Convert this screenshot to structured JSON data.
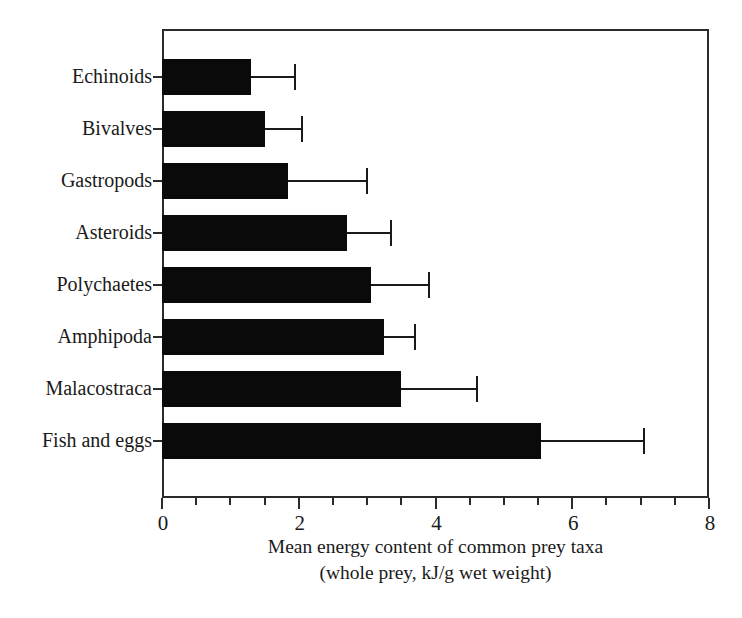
{
  "chart_data": {
    "type": "bar",
    "orientation": "horizontal",
    "title": "",
    "xlabel": "Mean energy content of common prey taxa (whole prey, kJ/g wet weight)",
    "xlabel_lines": [
      "Mean energy content of common prey taxa",
      "(whole prey, kJ/g wet weight)"
    ],
    "ylabel": "",
    "xlim": [
      0,
      8
    ],
    "xticks": [
      0,
      2,
      4,
      6,
      8
    ],
    "xtick_labels": [
      "0",
      "2",
      "4",
      "6",
      "8"
    ],
    "xminor_ticks": [
      0.5,
      1,
      1.5,
      2.5,
      3,
      3.5,
      4.5,
      5,
      5.5,
      6.5,
      7,
      7.5
    ],
    "grid": false,
    "legend": false,
    "bar_color": "#0a0a0a",
    "error_color": "#1a1a1a",
    "axis_color": "#2b2b2b",
    "categories": [
      "Echinoids",
      "Bivalves",
      "Gastropods",
      "Asteroids",
      "Polychaetes",
      "Amphipoda",
      "Malacostraca",
      "Fish and eggs"
    ],
    "values": [
      1.3,
      1.5,
      1.85,
      2.7,
      3.05,
      3.25,
      3.5,
      5.55
    ],
    "errors_upper": [
      1.95,
      2.05,
      3.0,
      3.35,
      3.9,
      3.7,
      4.6,
      7.05
    ],
    "series": [
      {
        "name": "Mean energy content",
        "values": [
          1.3,
          1.5,
          1.85,
          2.7,
          3.05,
          3.25,
          3.5,
          5.55
        ],
        "error_high": [
          1.95,
          2.05,
          3.0,
          3.35,
          3.9,
          3.7,
          4.6,
          7.05
        ]
      }
    ],
    "points": [
      {
        "category": "Echinoids",
        "value": 1.3,
        "error_high": 1.95
      },
      {
        "category": "Bivalves",
        "value": 1.5,
        "error_high": 2.05
      },
      {
        "category": "Gastropods",
        "value": 1.85,
        "error_high": 3.0
      },
      {
        "category": "Asteroids",
        "value": 2.7,
        "error_high": 3.35
      },
      {
        "category": "Polychaetes",
        "value": 3.05,
        "error_high": 3.9
      },
      {
        "category": "Amphipoda",
        "value": 3.25,
        "error_high": 3.7
      },
      {
        "category": "Malacostraca",
        "value": 3.5,
        "error_high": 4.6
      },
      {
        "category": "Fish and eggs",
        "value": 5.55,
        "error_high": 7.05
      }
    ]
  }
}
